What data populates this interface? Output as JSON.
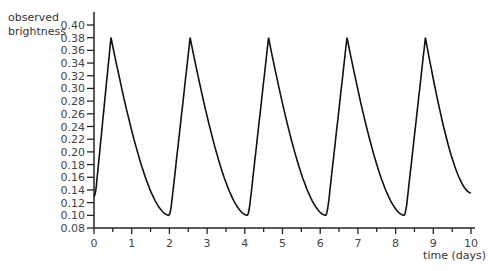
{
  "chart_data": {
    "type": "line",
    "title": "",
    "xlabel": "time (days)",
    "ylabel": "observed brightness",
    "ylabel_lines": [
      "observed",
      "brightness"
    ],
    "xlim": [
      0,
      10
    ],
    "ylim": [
      0.08,
      0.4
    ],
    "grid": false,
    "legend": null,
    "x_ticks": [
      0,
      1,
      2,
      3,
      4,
      5,
      6,
      7,
      8,
      9,
      10
    ],
    "x_minor_step": 0.5,
    "y_ticks": [
      "0.08",
      "0.10",
      "0.12",
      "0.14",
      "0.16",
      "0.18",
      "0.20",
      "0.22",
      "0.24",
      "0.26",
      "0.28",
      "0.30",
      "0.32",
      "0.34",
      "0.36",
      "0.38",
      "0.40"
    ],
    "period_days": 2.08,
    "series": [
      {
        "name": "observed brightness",
        "color": "#111111",
        "peaks": [
          [
            0.45,
            0.38
          ],
          [
            2.55,
            0.38
          ],
          [
            4.63,
            0.38
          ],
          [
            6.71,
            0.38
          ],
          [
            8.79,
            0.38
          ]
        ],
        "minima": [
          [
            1.98,
            0.1
          ],
          [
            4.06,
            0.1
          ],
          [
            6.14,
            0.1
          ],
          [
            8.22,
            0.1
          ]
        ],
        "start": [
          0,
          0.13
        ],
        "end": [
          10,
          0.135
        ]
      }
    ]
  }
}
